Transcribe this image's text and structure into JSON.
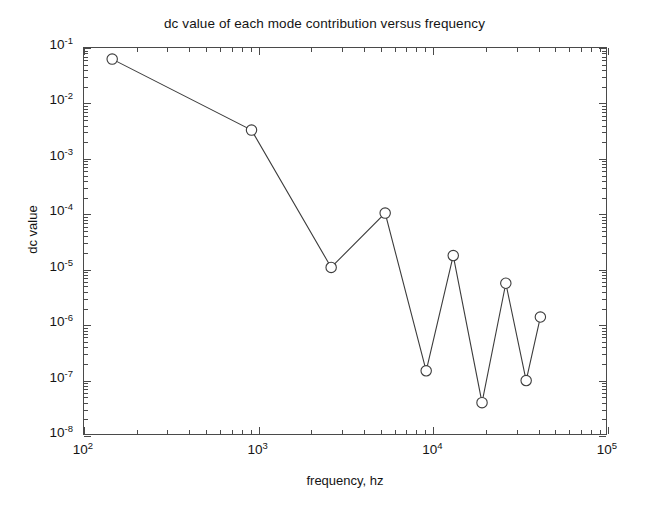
{
  "chart_data": {
    "type": "line",
    "title": "dc value of each mode contribution versus frequency",
    "xlabel": "frequency, hz",
    "ylabel": "dc value",
    "xscale": "log",
    "yscale": "log",
    "xlim": [
      100,
      100000
    ],
    "ylim": [
      1e-08,
      0.1
    ],
    "grid": false,
    "legend": null,
    "marker": "circle-open",
    "line_color": "#3c3c3c",
    "marker_color": "#3c3c3c",
    "x": [
      145,
      910,
      2600,
      5300,
      9100,
      13000,
      19000,
      26000,
      34000,
      41000
    ],
    "y": [
      0.063,
      0.0033,
      1.1e-05,
      0.000105,
      1.5e-07,
      1.8e-05,
      4e-08,
      5.7e-06,
      1e-07,
      1.4e-06
    ],
    "series": [
      {
        "name": "dc value",
        "points": [
          {
            "x": 145,
            "y": 0.063
          },
          {
            "x": 910,
            "y": 0.0033
          },
          {
            "x": 2600,
            "y": 1.1e-05
          },
          {
            "x": 5300,
            "y": 0.000105
          },
          {
            "x": 9100,
            "y": 1.5e-07
          },
          {
            "x": 13000,
            "y": 1.8e-05
          },
          {
            "x": 19000,
            "y": 4e-08
          },
          {
            "x": 26000,
            "y": 5.7e-06
          },
          {
            "x": 34000,
            "y": 1e-07
          },
          {
            "x": 41000,
            "y": 1.4e-06
          }
        ]
      }
    ],
    "xticks": [
      {
        "value": 100,
        "label": "10",
        "exponent": "2"
      },
      {
        "value": 1000,
        "label": "10",
        "exponent": "3"
      },
      {
        "value": 10000,
        "label": "10",
        "exponent": "4"
      },
      {
        "value": 100000,
        "label": "10",
        "exponent": "5"
      }
    ],
    "yticks": [
      {
        "value": 0.1,
        "label": "10",
        "exponent": "-1"
      },
      {
        "value": 0.01,
        "label": "10",
        "exponent": "-2"
      },
      {
        "value": 0.001,
        "label": "10",
        "exponent": "-3"
      },
      {
        "value": 0.0001,
        "label": "10",
        "exponent": "-4"
      },
      {
        "value": 1e-05,
        "label": "10",
        "exponent": "-5"
      },
      {
        "value": 1e-06,
        "label": "10",
        "exponent": "-6"
      },
      {
        "value": 1e-07,
        "label": "10",
        "exponent": "-7"
      },
      {
        "value": 1e-08,
        "label": "10",
        "exponent": "-8"
      }
    ]
  },
  "figure": {
    "background": "#ffffff",
    "axis_color": "#4a4a4a"
  }
}
